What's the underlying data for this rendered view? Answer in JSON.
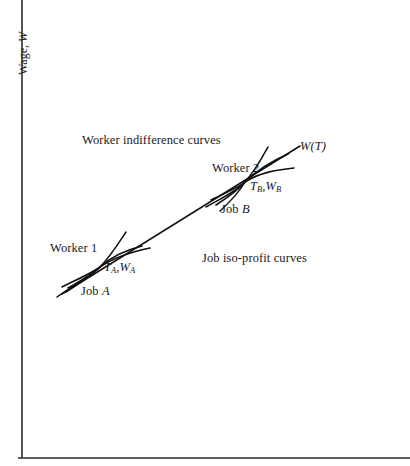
{
  "figure": {
    "type": "economics-diagram",
    "background_color": "#ffffff",
    "line_color": "#111111",
    "axis_color": "#2b2b2b"
  },
  "axes": {
    "y_label_prefix": "Wage, ",
    "y_label_symbol": "W",
    "y_axis_x": 22,
    "x_axis_y": 458,
    "x_label": ""
  },
  "annotations": {
    "worker_indifference_curves": "Worker indifference curves",
    "job_isoprofit_curves": "Job iso-profit curves",
    "worker_1": "Worker 1",
    "worker_2": "Worker 2",
    "job_a": "Job A",
    "job_b": "Job B",
    "wage_function": "W(T)",
    "point_a_prefix": "T",
    "point_a_sub1": "A",
    "point_a_mid": ",W",
    "point_a_sub2": "A",
    "point_b_prefix": "T",
    "point_b_sub1": "B",
    "point_b_mid": ",W",
    "point_b_sub2": "B"
  },
  "chart_data": {
    "type": "line",
    "title": "",
    "xlabel": "",
    "ylabel": "Wage, W",
    "grid": false,
    "legend": "inline-annotations",
    "tangency_points": [
      {
        "name": "A",
        "label": "TA,WA",
        "x_px": 100,
        "y_px": 267,
        "worker": "Worker 1",
        "job": "Job A"
      },
      {
        "name": "B",
        "label": "TB,WB",
        "x_px": 245,
        "y_px": 182,
        "worker": "Worker 2",
        "job": "Job B"
      }
    ],
    "series": [
      {
        "name": "W(T) hedonic wage function",
        "style": "straight-line",
        "from_px": [
          62,
          294
        ],
        "to_px": [
          300,
          146
        ]
      },
      {
        "name": "Worker 1 indifference curve",
        "style": "convex-curve",
        "through_px": [
          100,
          267
        ]
      },
      {
        "name": "Job A iso-profit curve",
        "style": "concave-curve",
        "through_px": [
          100,
          267
        ]
      },
      {
        "name": "Worker 2 indifference curve",
        "style": "convex-curve",
        "through_px": [
          245,
          182
        ]
      },
      {
        "name": "Job B iso-profit curve",
        "style": "concave-curve",
        "through_px": [
          245,
          182
        ]
      }
    ]
  }
}
